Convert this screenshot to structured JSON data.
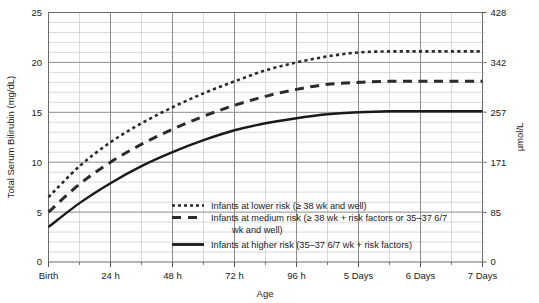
{
  "chart_data": {
    "type": "line",
    "title": "",
    "xlabel": "Age",
    "ylabel": "Total Serum Bilirubin (mg/dL)",
    "ylabel_right": "µmol/L",
    "grid": true,
    "legend_position": "inside-bottom-center",
    "xlim": [
      0,
      7
    ],
    "ylim": [
      0,
      25
    ],
    "ylim_right": [
      0,
      428
    ],
    "x_tick_values": [
      0,
      1,
      2,
      3,
      4,
      5,
      6,
      7
    ],
    "x_tick_labels": [
      "Birth",
      "24 h",
      "48 h",
      "72 h",
      "96 h",
      "5 Days",
      "6 Days",
      "7 Days"
    ],
    "y_tick_values": [
      0,
      5,
      10,
      15,
      20,
      25
    ],
    "y_tick_labels": [
      "0",
      "5",
      "10",
      "15",
      "20",
      "25"
    ],
    "y_right_tick_values": [
      0,
      85,
      171,
      257,
      342,
      428
    ],
    "y_right_tick_labels": [
      "0",
      "85",
      "171",
      "257",
      "342",
      "428"
    ],
    "y_minor_step": 1,
    "x_minor_step": 0.5,
    "x_units": "days",
    "series": [
      {
        "name": "Infants at lower risk (≥ 38 wk and well)",
        "style": "dotted",
        "color": "#2b2b2b",
        "x": [
          0,
          0.5,
          1,
          1.5,
          2,
          2.5,
          3,
          3.5,
          4,
          4.5,
          5,
          5.5,
          6,
          6.5,
          7
        ],
        "values": [
          6.5,
          9.6,
          12.0,
          13.9,
          15.5,
          16.9,
          18.1,
          19.2,
          20.0,
          20.6,
          21.0,
          21.1,
          21.1,
          21.1,
          21.1
        ]
      },
      {
        "name": "Infants at medium risk (≥ 38 wk + risk factors or 35–37 6/7 wk and well)",
        "style": "dashed",
        "color": "#2b2b2b",
        "x": [
          0,
          0.5,
          1,
          1.5,
          2,
          2.5,
          3,
          3.5,
          4,
          4.5,
          5,
          5.5,
          6,
          6.5,
          7
        ],
        "values": [
          5.0,
          7.8,
          10.0,
          11.8,
          13.3,
          14.6,
          15.7,
          16.6,
          17.3,
          17.8,
          18.0,
          18.1,
          18.1,
          18.1,
          18.1
        ]
      },
      {
        "name": "Infants at higher risk (35–37 6/7 wk + risk factors)",
        "style": "solid",
        "color": "#1a1a1a",
        "x": [
          0,
          0.5,
          1,
          1.5,
          2,
          2.5,
          3,
          3.5,
          4,
          4.5,
          5,
          5.5,
          6,
          6.5,
          7
        ],
        "values": [
          3.5,
          5.9,
          7.9,
          9.6,
          11.0,
          12.2,
          13.2,
          13.9,
          14.4,
          14.8,
          15.0,
          15.1,
          15.1,
          15.1,
          15.1
        ]
      }
    ]
  },
  "legend": {
    "items": [
      {
        "label": "Infants at lower risk (≥ 38 wk and well)",
        "style": "dotted"
      },
      {
        "label": "Infants at medium risk (≥ 38 wk + risk factors or 35–37 6/7",
        "label_line2": "wk and well)",
        "style": "dashed"
      },
      {
        "label": "Infants at higher risk (35–37 6/7 wk + risk factors)",
        "style": "solid"
      }
    ]
  },
  "colors": {
    "major_grid": "#8c8c8c",
    "minor_grid": "#c9c9c9",
    "axis": "#555555",
    "curve": "#1f1f1f",
    "text": "#1a1a1a",
    "background": "#ffffff"
  }
}
